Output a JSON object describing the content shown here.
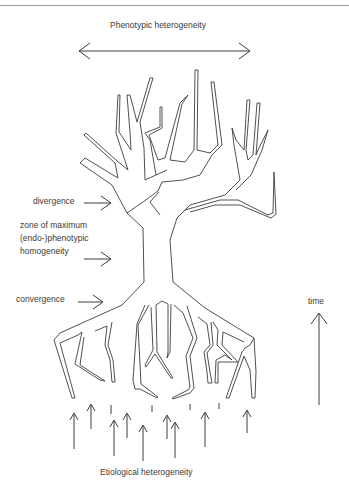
{
  "diagram": {
    "title_top": "Phenotypic heterogeneity",
    "title_bottom": "Etiological heterogeneity",
    "labels": {
      "divergence": "divergence",
      "zone_line1": "zone of maximum",
      "zone_line2": "(endo-)phenotypic",
      "zone_line3": "homogeneity",
      "convergence": "convergence",
      "time": "time"
    },
    "arrows": {
      "top": "double-headed horizontal arrow",
      "time": "upward arrow",
      "pointer_count": 3,
      "bottom_upward_count": 13
    },
    "colors": {
      "line": "#3c3c3c",
      "background": "#ffffff",
      "rule": "#9a9a9a"
    }
  }
}
